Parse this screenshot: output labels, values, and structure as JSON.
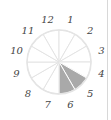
{
  "diagram": {
    "type": "clock-fraction",
    "sectors": 12,
    "labels": [
      "12",
      "1",
      "2",
      "3",
      "4",
      "5",
      "6",
      "7",
      "8",
      "9",
      "10",
      "11"
    ],
    "shaded_sectors": [
      "5",
      "6"
    ],
    "colors": {
      "shade": "#a9a9a9",
      "lines": "#e4e4e4",
      "separator": "#d8d8d8"
    }
  }
}
